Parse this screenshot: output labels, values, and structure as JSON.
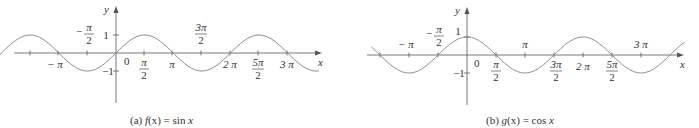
{
  "chart_data": [
    {
      "type": "line",
      "id": "a",
      "title": "(a) f(x) = sin x",
      "caption_prefix": "(a)",
      "caption_func": "f(x)",
      "caption_expr": "= sin x",
      "xlabel": "x",
      "ylabel": "y",
      "function": "sin",
      "x_range": [
        -3.6,
        3.55
      ],
      "x_range_unit": "pi",
      "ylim": [
        -1,
        1
      ],
      "y_ticks": [
        {
          "value": 1,
          "label": "1"
        },
        {
          "value": -1,
          "label": "-1"
        }
      ],
      "x_ticks": [
        {
          "value": -1.5,
          "label": ""
        },
        {
          "value": -1,
          "label": "−π",
          "pos": "below"
        },
        {
          "value": -0.5,
          "label": "−π/2",
          "pos": "above"
        },
        {
          "value": 0,
          "label": "0",
          "pos": "below"
        },
        {
          "value": 0.5,
          "label": "π/2",
          "pos": "below"
        },
        {
          "value": 1,
          "label": "π",
          "pos": "below"
        },
        {
          "value": 1.5,
          "label": "3π/2",
          "pos": "above"
        },
        {
          "value": 2,
          "label": "2π",
          "pos": "below"
        },
        {
          "value": 2.5,
          "label": "5π/2",
          "pos": "below"
        },
        {
          "value": 3,
          "label": "3π",
          "pos": "below"
        }
      ],
      "grid": false,
      "legend": "none"
    },
    {
      "type": "line",
      "id": "b",
      "title": "(b) g(x) = cos x",
      "caption_prefix": "(b)",
      "caption_func": "g(x)",
      "caption_expr": "= cos x",
      "xlabel": "x",
      "ylabel": "y",
      "function": "cos",
      "x_range": [
        -1.65,
        3.75
      ],
      "x_range_unit": "pi",
      "ylim": [
        -1,
        1
      ],
      "y_ticks": [
        {
          "value": 1,
          "label": "1"
        },
        {
          "value": -1,
          "label": "-1"
        }
      ],
      "x_ticks": [
        {
          "value": -1.5,
          "label": ""
        },
        {
          "value": -1,
          "label": "−π",
          "pos": "above"
        },
        {
          "value": -0.5,
          "label": "−π/2",
          "pos": "above"
        },
        {
          "value": 0,
          "label": "0",
          "pos": "below"
        },
        {
          "value": 0.5,
          "label": "π/2",
          "pos": "below"
        },
        {
          "value": 1,
          "label": "π",
          "pos": "above"
        },
        {
          "value": 1.5,
          "label": "3π/2",
          "pos": "below"
        },
        {
          "value": 2,
          "label": "2π",
          "pos": "below"
        },
        {
          "value": 2.5,
          "label": "5π/2",
          "pos": "below"
        },
        {
          "value": 3,
          "label": "3π",
          "pos": "above"
        }
      ],
      "grid": false,
      "legend": "none"
    }
  ],
  "labels": {
    "x": "x",
    "y": "y",
    "one": "1",
    "neg_one": "−1",
    "zero": "0",
    "pi": "π",
    "neg_pi": "− π",
    "neg": "−",
    "two": "2",
    "three": "3",
    "five": "5",
    "two_pi": "2 π",
    "three_pi": "3 π",
    "three_pi_num": "3π",
    "five_pi_num": "5π"
  },
  "captions": {
    "a_prefix": "(a) ",
    "a_func": "f",
    "a_arg": "(x)",
    "a_rest": " = sin ",
    "a_var": "x",
    "b_prefix": "(b) ",
    "b_func": "g",
    "b_arg": "(x)",
    "b_rest": " = cos ",
    "b_var": "x"
  },
  "colors": {
    "axis": "#555555",
    "curve": "#8a8a8a",
    "text": "#333333"
  }
}
